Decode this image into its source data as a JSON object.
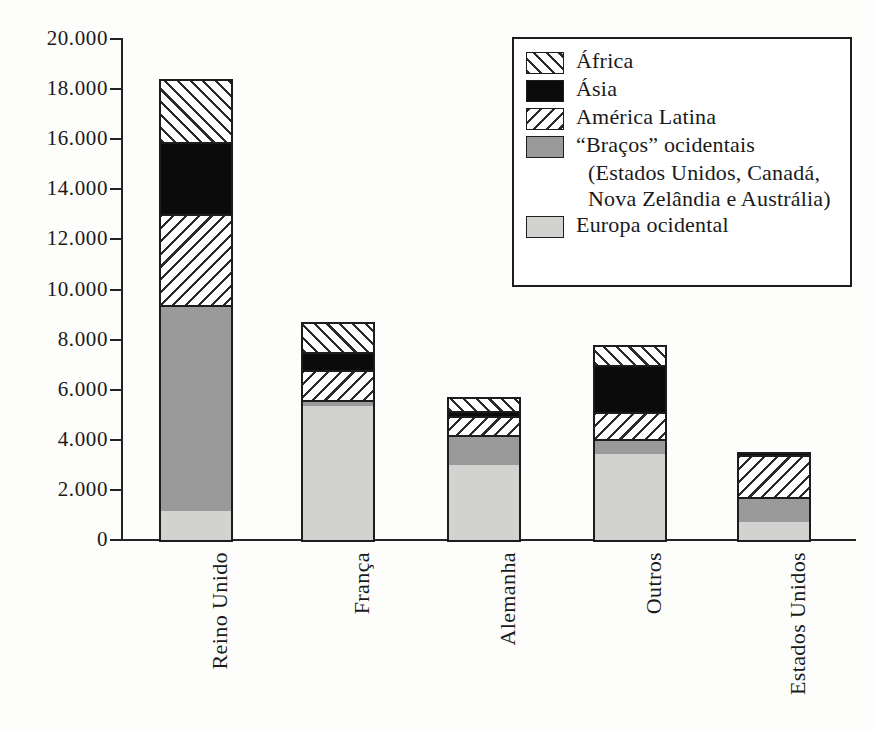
{
  "chart_data": {
    "type": "bar",
    "subtype": "stacked-bar",
    "title": "",
    "xlabel": "",
    "ylabel": "",
    "ylim": [
      0,
      20000
    ],
    "ytick_step": 2000,
    "ytick_labels": [
      "20.000",
      "18.000",
      "16.000",
      "14.000",
      "12.000",
      "10.000",
      "8.000",
      "6.000",
      "4.000",
      "2.000",
      "0"
    ],
    "ytick_values": [
      20000,
      18000,
      16000,
      14000,
      12000,
      10000,
      8000,
      6000,
      4000,
      2000,
      0
    ],
    "grid": false,
    "legend_position": "top-right",
    "categories": [
      "Reino Unido",
      "França",
      "Alemanha",
      "Outros",
      "Estados Unidos"
    ],
    "series": [
      {
        "name": "Europa ocidental",
        "values": [
          1150,
          5350,
          3000,
          3450,
          700
        ]
      },
      {
        "name": "“Braços” ocidentais",
        "values": [
          8250,
          250,
          1200,
          600,
          1000
        ]
      },
      {
        "name": "América Latina",
        "values": [
          3600,
          1200,
          750,
          1050,
          1700
        ]
      },
      {
        "name": "Ásia",
        "values": [
          2900,
          700,
          200,
          1900,
          120
        ]
      },
      {
        "name": "África",
        "values": [
          2500,
          1200,
          550,
          800,
          0
        ]
      }
    ],
    "totals": [
      18400,
      8700,
      5700,
      7800,
      3520
    ],
    "stack_order_bottom_to_top": [
      "Europa ocidental",
      "“Braços” ocidentais",
      "América Latina",
      "Ásia",
      "África"
    ]
  },
  "legend": {
    "items": [
      {
        "label": "África",
        "pattern": "diagonal-hatch-forward",
        "swatch": "africa-swatch"
      },
      {
        "label": "Ásia",
        "pattern": "solid-black",
        "swatch": "asia-swatch"
      },
      {
        "label": "América Latina",
        "pattern": "diagonal-hatch-backward",
        "swatch": "america-latina-swatch"
      },
      {
        "label": "“Braços” ocidentais",
        "pattern": "solid-gray",
        "swatch": "bracos-swatch",
        "sublines": [
          "(Estados Unidos, Canadá,",
          "Nova Zelândia e Austrália)"
        ]
      },
      {
        "label": "Europa ocidental",
        "pattern": "solid-light-gray",
        "swatch": "europa-swatch"
      }
    ]
  },
  "colors": {
    "europa": "#d2d2d0",
    "bracos": "#9a9a9a",
    "asia": "#0b0b0b",
    "hatch_line": "#2a2a2a",
    "hatch_bg": "#ffffff",
    "axis": "#232323",
    "bar_border": "#1d1d1d",
    "background": "#fdfdfb"
  },
  "axis_labels": {
    "x": [
      "Reino Unido",
      "França",
      "Alemanha",
      "Outros",
      "Estados Unidos"
    ]
  }
}
